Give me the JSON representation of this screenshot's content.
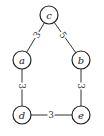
{
  "diagram": {
    "type": "weighted-undirected-graph",
    "nodes": [
      {
        "id": "c",
        "label": "c",
        "x": 49,
        "y": 15
      },
      {
        "id": "a",
        "label": "a",
        "x": 22,
        "y": 60
      },
      {
        "id": "b",
        "label": "b",
        "x": 81,
        "y": 60
      },
      {
        "id": "d",
        "label": "d",
        "x": 22,
        "y": 115
      },
      {
        "id": "e",
        "label": "e",
        "x": 81,
        "y": 115
      }
    ],
    "edges": [
      {
        "from": "c",
        "to": "a",
        "weight": "3"
      },
      {
        "from": "c",
        "to": "b",
        "weight": "5"
      },
      {
        "from": "a",
        "to": "d",
        "weight": "3"
      },
      {
        "from": "b",
        "to": "e",
        "weight": "3"
      },
      {
        "from": "d",
        "to": "e",
        "weight": "3"
      }
    ]
  },
  "labels": {
    "node_c": "c",
    "node_a": "a",
    "node_b": "b",
    "node_d": "d",
    "node_e": "e",
    "edge_ca": "3",
    "edge_cb": "5",
    "edge_ad": "3",
    "edge_be": "3",
    "edge_de": "3"
  }
}
